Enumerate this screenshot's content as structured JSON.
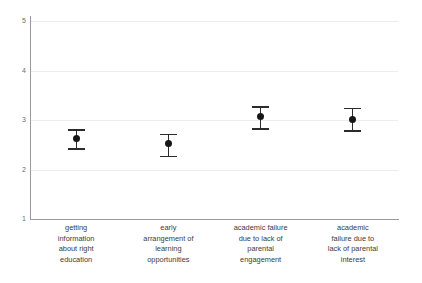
{
  "chart_data": {
    "type": "scatter",
    "title": "",
    "xlabel": "",
    "ylabel": "",
    "ylim": [
      1,
      5
    ],
    "grid": true,
    "legend": "none",
    "error_bar_type": "confidence-interval",
    "yticks": [
      "5",
      "4",
      "3",
      "2",
      "1"
    ],
    "ytick_values": [
      5,
      4,
      3,
      2,
      1
    ],
    "categories": [
      "getting information about right education",
      "early arrangement of learning opportunities",
      "academic failure due to lack of parental engagement",
      "academic failure due to lack of parental interest"
    ],
    "category_lines": [
      [
        "getting",
        "information",
        "about right",
        "education"
      ],
      [
        "early",
        "arrangement of",
        "learning",
        "opportunities"
      ],
      [
        "academic failure",
        "due to lack of",
        "parental",
        "engagement"
      ],
      [
        "academic",
        "failure due to",
        "lack of parental",
        "interest"
      ]
    ],
    "values": [
      2.62,
      2.52,
      3.07,
      3.02
    ],
    "error_low": [
      2.43,
      2.28,
      2.83,
      2.79
    ],
    "error_high": [
      2.81,
      2.72,
      3.28,
      3.25
    ],
    "marker_color": "#161616",
    "error_color": "#2b2b2b",
    "grid_color": "#ededed",
    "axis_color": "#9a9a9a",
    "background": "#ffffff"
  }
}
